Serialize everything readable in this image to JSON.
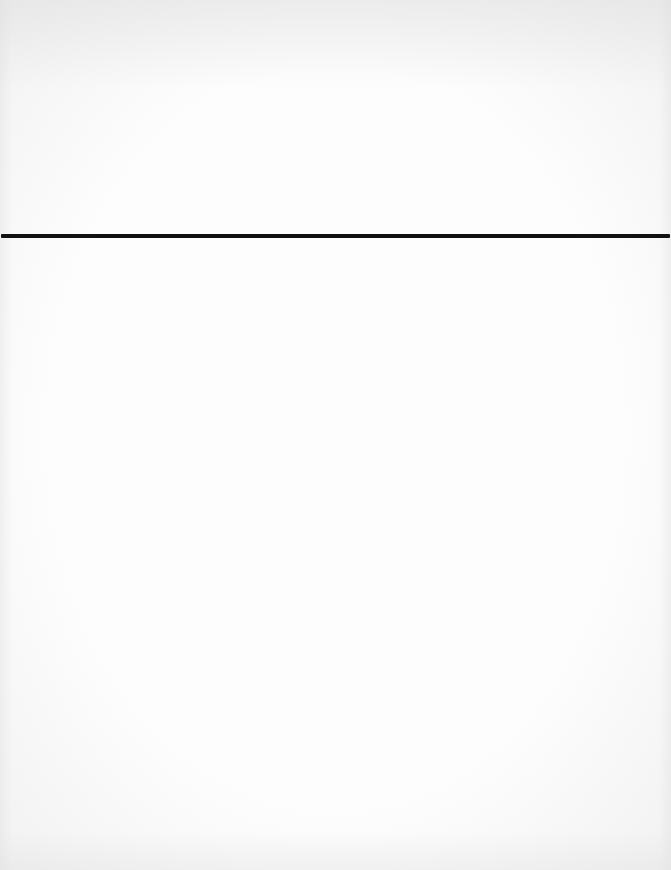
{
  "page": {
    "background_color": "#fdfdfd",
    "content": "blank"
  },
  "rule": {
    "top_px": 234,
    "color": "#111111",
    "thickness_px": 4
  }
}
